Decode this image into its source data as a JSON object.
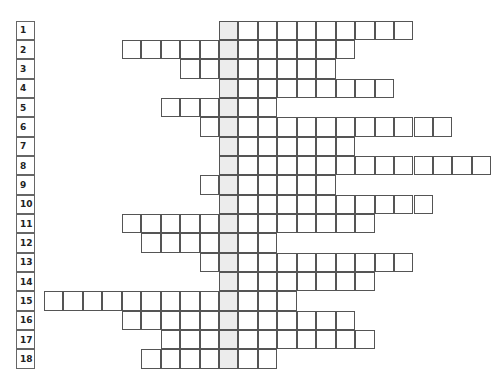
{
  "puzzle": {
    "type": "crossword-column-puzzle",
    "highlight_column_index": 0,
    "highlight_color": "#ececec",
    "border_color": "#555555",
    "rows": [
      {
        "number": "1",
        "start": 0,
        "end": 9
      },
      {
        "number": "2",
        "start": -5,
        "end": 6
      },
      {
        "number": "3",
        "start": -2,
        "end": 5
      },
      {
        "number": "4",
        "start": 0,
        "end": 8
      },
      {
        "number": "5",
        "start": -3,
        "end": 2
      },
      {
        "number": "6",
        "start": -1,
        "end": 11
      },
      {
        "number": "7",
        "start": 0,
        "end": 6
      },
      {
        "number": "8",
        "start": 0,
        "end": 13
      },
      {
        "number": "9",
        "start": -1,
        "end": 5
      },
      {
        "number": "10",
        "start": 0,
        "end": 10
      },
      {
        "number": "11",
        "start": -5,
        "end": 7
      },
      {
        "number": "12",
        "start": -4,
        "end": 2
      },
      {
        "number": "13",
        "start": -1,
        "end": 9
      },
      {
        "number": "14",
        "start": 0,
        "end": 7
      },
      {
        "number": "15",
        "start": -9,
        "end": 3
      },
      {
        "number": "16",
        "start": -5,
        "end": 6
      },
      {
        "number": "17",
        "start": -3,
        "end": 7
      },
      {
        "number": "18",
        "start": -4,
        "end": 2
      }
    ]
  }
}
